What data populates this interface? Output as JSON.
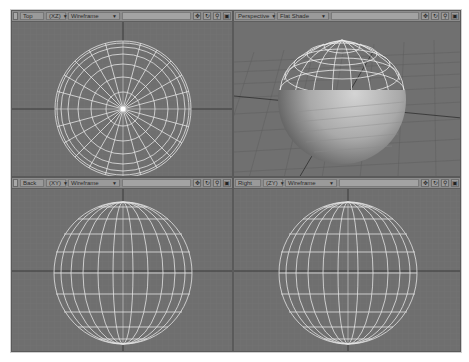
{
  "viewports": [
    {
      "id": "top",
      "view_label": "Top",
      "axis_label": "(XZ)",
      "shading_mode": "Wireframe",
      "tools": [
        "move-icon",
        "rotate-icon",
        "zoom-icon",
        "maximize-icon"
      ]
    },
    {
      "id": "perspective",
      "view_label": "Perspective",
      "shading_mode": "Flat Shade",
      "tools": [
        "move-icon",
        "rotate-icon",
        "zoom-icon",
        "maximize-icon"
      ]
    },
    {
      "id": "back",
      "view_label": "Back",
      "axis_label": "(XY)",
      "shading_mode": "Wireframe",
      "tools": [
        "move-icon",
        "rotate-icon",
        "zoom-icon",
        "maximize-icon"
      ]
    },
    {
      "id": "right",
      "view_label": "Right",
      "axis_label": "(ZY)",
      "shading_mode": "Wireframe",
      "tools": [
        "move-icon",
        "rotate-icon",
        "zoom-icon",
        "maximize-icon"
      ]
    }
  ],
  "icons": {
    "move": "✥",
    "rotate": "↻",
    "zoom": "⚲",
    "maximize": "▣",
    "dropdown": "▼"
  },
  "colors": {
    "viewport_bg": "#6f6f6f",
    "wire": "#e8e8e8",
    "grid": "#777777",
    "axis": "#2a2a2a"
  }
}
